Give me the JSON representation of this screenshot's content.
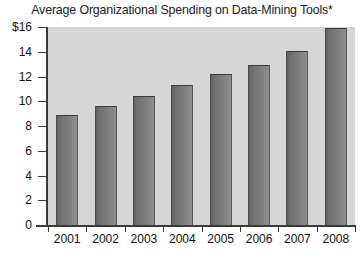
{
  "chart_data": {
    "type": "bar",
    "title": "Average Organizational Spending on Data-Mining Tools*",
    "xlabel": "",
    "ylabel": "",
    "categories": [
      "2001",
      "2002",
      "2003",
      "2004",
      "2005",
      "2006",
      "2007",
      "2008"
    ],
    "values": [
      8.9,
      9.6,
      10.4,
      11.3,
      12.2,
      12.9,
      14.1,
      15.9
    ],
    "ytick_labels": [
      "$16",
      "14",
      "12",
      "10",
      "8",
      "6",
      "4",
      "2",
      "0"
    ],
    "ytick_values": [
      16,
      14,
      12,
      10,
      8,
      6,
      4,
      2,
      0
    ],
    "ylim": [
      0,
      16
    ],
    "grid": false,
    "legend": null,
    "series": [
      {
        "name": "Average spending",
        "values": [
          8.9,
          9.6,
          10.4,
          11.3,
          12.2,
          12.9,
          14.1,
          15.9
        ]
      }
    ],
    "colors": {
      "bar_dark": "#5f5f5f",
      "bar_light": "#8f8f8f",
      "plot_background": "#d6d6d6",
      "axis": "#3a3a3a",
      "text": "#111111",
      "figure_background": "#ffffff"
    }
  }
}
